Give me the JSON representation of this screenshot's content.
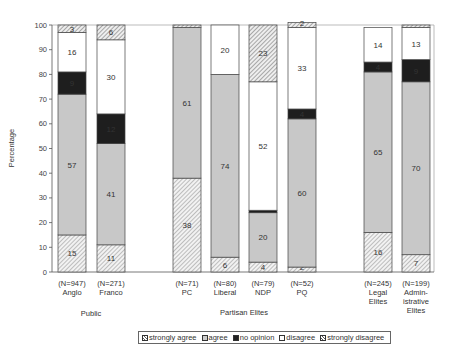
{
  "chart_data": {
    "type": "bar",
    "stacked": true,
    "title": "",
    "xlabel": "",
    "ylabel": "Percentage",
    "ylim": [
      0,
      100
    ],
    "yticks": [
      0,
      10,
      20,
      30,
      40,
      50,
      60,
      70,
      80,
      90,
      100
    ],
    "grid": false,
    "legend_position": "bottom",
    "categories": [
      {
        "n": "(N=947)",
        "name": "Anglo",
        "group": "Public"
      },
      {
        "n": "(N=271)",
        "name": "Franco",
        "group": "Public"
      },
      {
        "n": "(N=71)",
        "name": "PC",
        "group": "Partisan Elites"
      },
      {
        "n": "(N=80)",
        "name": "Liberal",
        "group": "Partisan Elites"
      },
      {
        "n": "(N=79)",
        "name": "NDP",
        "group": "Partisan Elites"
      },
      {
        "n": "(N=52)",
        "name": "PQ",
        "group": "Partisan Elites"
      },
      {
        "n": "(N=245)",
        "name": "Legal Elites",
        "group": ""
      },
      {
        "n": "(N=199)",
        "name": "Admin-istrative Elites",
        "group": ""
      }
    ],
    "series": [
      {
        "name": "strongly agree",
        "values": [
          15,
          11,
          38,
          6,
          4,
          2,
          16,
          7
        ]
      },
      {
        "name": "agree",
        "values": [
          57,
          41,
          61,
          74,
          20,
          60,
          65,
          70
        ]
      },
      {
        "name": "no opinion",
        "values": [
          9,
          12,
          0,
          0,
          1,
          4,
          4,
          9
        ]
      },
      {
        "name": "disagree",
        "values": [
          16,
          30,
          0,
          20,
          52,
          33,
          14,
          13
        ]
      },
      {
        "name": "strongly disagree",
        "values": [
          3,
          6,
          1,
          0,
          23,
          2,
          0,
          1
        ]
      }
    ],
    "segment_labels": [
      [
        "15",
        "57",
        "9",
        "16",
        "3"
      ],
      [
        "11",
        "41",
        "12",
        "30",
        "6"
      ],
      [
        "38",
        "61",
        "",
        "",
        ""
      ],
      [
        "6",
        "74",
        "",
        "20",
        ""
      ],
      [
        "4",
        "20",
        "",
        "52",
        "23"
      ],
      [
        "2",
        "60",
        "4",
        "33",
        "2"
      ],
      [
        "16",
        "65",
        "4",
        "14",
        ""
      ],
      [
        "7",
        "70",
        "9",
        "13",
        ""
      ]
    ],
    "group_labels": [
      "Public",
      "Partisan Elites"
    ]
  },
  "legend": {
    "items": [
      "strongly agree",
      "agree",
      "no opinion",
      "disagree",
      "strongly disagree"
    ]
  }
}
